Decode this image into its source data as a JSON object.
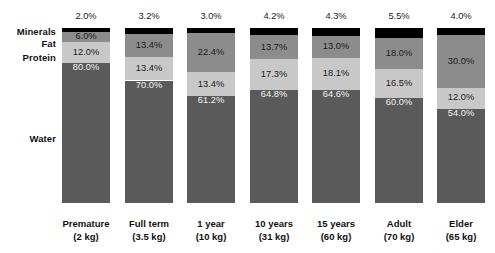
{
  "chart_data": {
    "type": "bar",
    "subtype": "stacked-bar-100",
    "title": "",
    "xlabel": "",
    "ylabel": "",
    "ylim": [
      0,
      100
    ],
    "grid": false,
    "legend_position": "left-row-labels",
    "orientation": "vertical",
    "stack_order_top_to_bottom": [
      "Minerals",
      "Fat",
      "Protein",
      "Water"
    ],
    "categories": [
      "Premature",
      "Full term",
      "1 year",
      "10 years",
      "15 years",
      "Adult",
      "Elder"
    ],
    "category_sublabels": [
      "(2 kg)",
      "(3.5 kg)",
      "(10 kg)",
      "(31 kg)",
      "(60 kg)",
      "(70 kg)",
      "(65 kg)"
    ],
    "series": [
      {
        "name": "Minerals",
        "color": "#000000",
        "label_color": "#1a1a1a",
        "label_outside": true,
        "values": [
          2.0,
          3.2,
          3.0,
          4.2,
          4.3,
          5.5,
          4.0
        ],
        "labels": [
          "2.0%",
          "3.2%",
          "3.0%",
          "4.2%",
          "4.3%",
          "5.5%",
          "4.0%"
        ]
      },
      {
        "name": "Fat",
        "color": "#8c8c8c",
        "label_color": "#1a1a1a",
        "label_outside": false,
        "values": [
          6.0,
          13.4,
          22.4,
          13.7,
          13.0,
          18.0,
          30.0
        ],
        "labels": [
          "6.0%",
          "13.4%",
          "22.4%",
          "13.7%",
          "13.0%",
          "18.0%",
          "30.0%"
        ]
      },
      {
        "name": "Protein",
        "color": "#c8c8c8",
        "label_color": "#1a1a1a",
        "label_outside": false,
        "values": [
          12.0,
          13.4,
          13.4,
          17.3,
          18.1,
          16.5,
          12.0
        ],
        "labels": [
          "12.0%",
          "13.4%",
          "13.4%",
          "17.3%",
          "18.1%",
          "16.5%",
          "12.0%"
        ]
      },
      {
        "name": "Water",
        "color": "#5a5a5a",
        "label_color": "#f2f2f2",
        "label_outside": false,
        "values": [
          80.0,
          70.0,
          61.2,
          64.8,
          64.6,
          60.0,
          54.0
        ],
        "labels": [
          "80.0%",
          "70.0%",
          "61.2%",
          "64.8%",
          "64.6%",
          "60.0%",
          "54.0%"
        ]
      }
    ]
  },
  "row_labels": [
    "Minerals",
    "Fat",
    "Protein",
    "Water"
  ],
  "colors": {
    "minerals": "#000000",
    "fat": "#8c8c8c",
    "protein": "#c8c8c8",
    "water": "#5a5a5a",
    "background": "#ffffff",
    "text": "#111111"
  }
}
